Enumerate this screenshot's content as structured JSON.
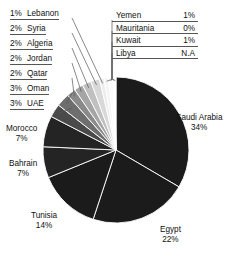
{
  "chart_data": {
    "type": "pie",
    "title": "",
    "xlabel": "",
    "ylabel": "",
    "legend_position": "callout-labels",
    "grid": false,
    "value_suffix": "%",
    "start_angle_deg": 0,
    "direction": "clockwise",
    "categories": [
      "Saudi Arabia",
      "Egypt",
      "Tunisia",
      "Bahrain",
      "Morocco",
      "UAE",
      "Oman",
      "Qatar",
      "Jordan",
      "Algeria",
      "Syria",
      "Lebanon",
      "Yemen",
      "Kuwait",
      "Mauritania",
      "Libya"
    ],
    "values": [
      34,
      22,
      14,
      7,
      7,
      3,
      3,
      2,
      2,
      2,
      2,
      1,
      1,
      1,
      0,
      null
    ],
    "labels": [
      "34%",
      "22%",
      "14%",
      "7%",
      "7%",
      "3%",
      "3%",
      "2%",
      "2%",
      "2%",
      "2%",
      "1%",
      "1%",
      "1%",
      "0%",
      "N.A"
    ],
    "slices": [
      {
        "name": "Saudi Arabia",
        "value": 34,
        "label": "34%",
        "color": "#1b1b1b"
      },
      {
        "name": "Egypt",
        "value": 22,
        "label": "22%",
        "color": "#1b1b1b"
      },
      {
        "name": "Tunisia",
        "value": 14,
        "label": "14%",
        "color": "#1b1b1b"
      },
      {
        "name": "Bahrain",
        "value": 7,
        "label": "7%",
        "color": "#242424"
      },
      {
        "name": "Morocco",
        "value": 7,
        "label": "7%",
        "color": "#242424"
      },
      {
        "name": "UAE",
        "value": 3,
        "label": "3%",
        "color": "#4a4a4a"
      },
      {
        "name": "Oman",
        "value": 3,
        "label": "3%",
        "color": "#6e6e6e"
      },
      {
        "name": "Qatar",
        "value": 2,
        "label": "2%",
        "color": "#8a8a8a"
      },
      {
        "name": "Jordan",
        "value": 2,
        "label": "2%",
        "color": "#a5a5a5"
      },
      {
        "name": "Algeria",
        "value": 2,
        "label": "2%",
        "color": "#c0c0c0"
      },
      {
        "name": "Syria",
        "value": 2,
        "label": "2%",
        "color": "#d8d8d8"
      },
      {
        "name": "Lebanon",
        "value": 1,
        "label": "1%",
        "color": "#ececec"
      },
      {
        "name": "Yemen",
        "value": 1,
        "label": "1%",
        "color": "#f4f4f4"
      },
      {
        "name": "Kuwait",
        "value": 1,
        "label": "1%",
        "color": "#fbfbfb"
      },
      {
        "name": "Mauritania",
        "value": 0.4,
        "label": "0%",
        "color": "#ffffff"
      },
      {
        "name": "Libya",
        "value": 0.3,
        "label": "N.A",
        "color": "#ffffff"
      }
    ]
  },
  "left_callouts": [
    {
      "pct": "1%",
      "name": "Lebanon"
    },
    {
      "pct": "2%",
      "name": "Syria"
    },
    {
      "pct": "2%",
      "name": "Algeria"
    },
    {
      "pct": "2%",
      "name": "Jordan"
    },
    {
      "pct": "2%",
      "name": "Qatar"
    },
    {
      "pct": "3%",
      "name": "Oman"
    },
    {
      "pct": "3%",
      "name": "UAE"
    }
  ],
  "right_box": [
    {
      "name": "Yemen",
      "pct": "1%"
    },
    {
      "name": "Mauritania",
      "pct": "0%"
    },
    {
      "name": "Kuwait",
      "pct": "1%"
    },
    {
      "name": "Libya",
      "pct": "N.A"
    }
  ],
  "outer_labels": {
    "saudi_name": "Saudi Arabia",
    "saudi_pct": "34%",
    "egypt_name": "Egypt",
    "egypt_pct": "22%",
    "tunisia_name": "Tunisia",
    "tunisia_pct": "14%",
    "bahrain_name": "Bahrain",
    "bahrain_pct": "7%",
    "morocco_name": "Morocco",
    "morocco_pct": "7%"
  },
  "colors": {
    "background": "#ffffff",
    "text": "#111111",
    "leader_line": "#555555",
    "slice_dark": "#1b1b1b",
    "slice_edge": "#ffffff"
  }
}
